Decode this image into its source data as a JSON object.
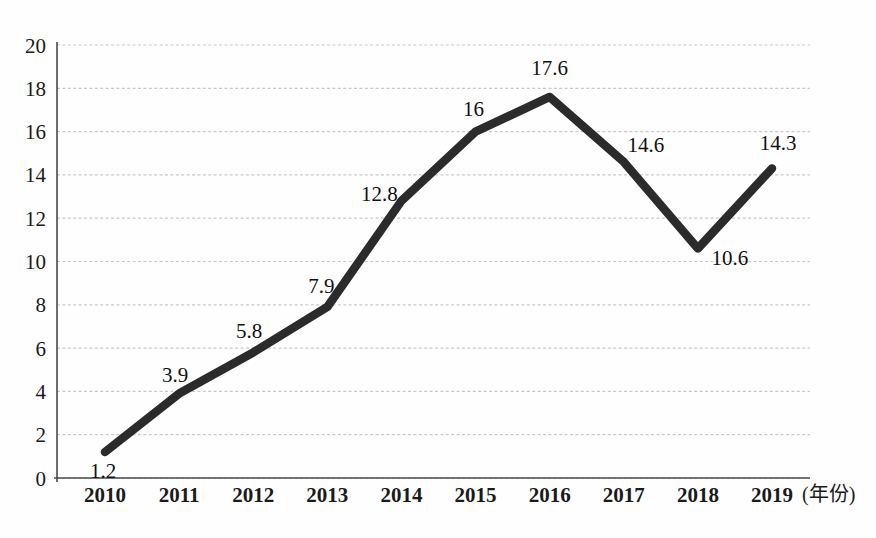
{
  "chart_data": {
    "type": "line",
    "title": "",
    "subtitle": "",
    "xlabel": "(年份)",
    "ylabel": "",
    "categories": [
      "2010",
      "2011",
      "2012",
      "2013",
      "2014",
      "2015",
      "2016",
      "2017",
      "2018",
      "2019"
    ],
    "values": [
      1.2,
      3.9,
      5.8,
      7.9,
      12.8,
      16,
      17.6,
      14.6,
      10.6,
      14.3
    ],
    "point_labels": [
      "1.2",
      "3.9",
      "5.8",
      "7.9",
      "12.8",
      "16",
      "17.6",
      "14.6",
      "10.6",
      "14.3"
    ],
    "series": [
      {
        "name": "",
        "values": [
          1.2,
          3.9,
          5.8,
          7.9,
          12.8,
          16,
          17.6,
          14.6,
          10.6,
          14.3
        ]
      }
    ],
    "ylim": [
      0,
      20
    ],
    "ytick_step": 2,
    "ytick_labels": [
      "0",
      "2",
      "4",
      "6",
      "8",
      "10",
      "12",
      "14",
      "16",
      "18",
      "20"
    ],
    "grid": true,
    "grid_style": "dotted-horizontal",
    "legend": false,
    "legend_position": "none",
    "annotations": [],
    "colors": {
      "line": "#2b2b2b",
      "grid": "#c9c9c9",
      "axis": "#4a4a4a",
      "text": "#1a1a1a",
      "background": "#fefefe"
    },
    "label_offsets": [
      {
        "dx": -2,
        "dy": 26
      },
      {
        "dx": -4,
        "dy": -12
      },
      {
        "dx": -4,
        "dy": -14
      },
      {
        "dx": -6,
        "dy": -14
      },
      {
        "dx": -22,
        "dy": 0
      },
      {
        "dx": -2,
        "dy": -16
      },
      {
        "dx": 0,
        "dy": -22
      },
      {
        "dx": 22,
        "dy": -10
      },
      {
        "dx": 32,
        "dy": 16
      },
      {
        "dx": 6,
        "dy": -18
      }
    ]
  }
}
